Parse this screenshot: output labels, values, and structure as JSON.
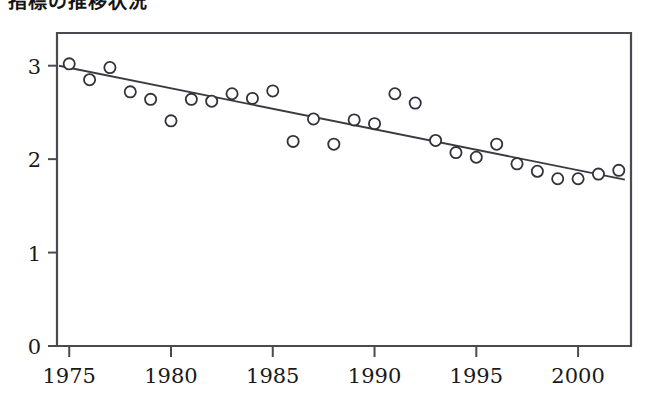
{
  "chart_data": {
    "type": "scatter",
    "title": "指標の推移状況",
    "xlabel": "",
    "ylabel": "",
    "xlim": [
      1974.4,
      2002.6
    ],
    "ylim": [
      0,
      3.35
    ],
    "grid": false,
    "legend": "none",
    "xticks": [
      1975,
      1980,
      1985,
      1990,
      1995,
      2000
    ],
    "xtick_labels": [
      "1975",
      "1980",
      "1985",
      "1990",
      "1995",
      "2000"
    ],
    "yticks": [
      0,
      1,
      2,
      3
    ],
    "ytick_labels": [
      "0",
      "1",
      "2",
      "3"
    ],
    "series": [
      {
        "name": "observed",
        "marker": "open-circle",
        "x": [
          1975,
          1976,
          1977,
          1978,
          1979,
          1980,
          1981,
          1982,
          1983,
          1984,
          1985,
          1986,
          1987,
          1988,
          1989,
          1990,
          1991,
          1992,
          1993,
          1994,
          1995,
          1996,
          1997,
          1998,
          1999,
          2000,
          2001,
          2002
        ],
        "y": [
          3.02,
          2.85,
          2.98,
          2.72,
          2.64,
          2.41,
          2.64,
          2.62,
          2.7,
          2.65,
          2.73,
          2.19,
          2.43,
          2.16,
          2.42,
          2.38,
          2.7,
          2.6,
          2.2,
          2.07,
          2.02,
          2.16,
          1.95,
          1.87,
          1.79,
          1.79,
          1.84,
          1.88
        ]
      },
      {
        "name": "trend",
        "type": "line",
        "x": [
          1974.5,
          2002.3
        ],
        "y": [
          3.0,
          1.78
        ]
      }
    ],
    "annotations": []
  },
  "figure": {
    "title": "指標の推移状況",
    "background_color": "#ffffff",
    "axis_color": "#4a4a52",
    "marker_edge_color": "#32323a",
    "marker_fill_color": "#ffffff",
    "trend_color": "#3a3a42"
  }
}
